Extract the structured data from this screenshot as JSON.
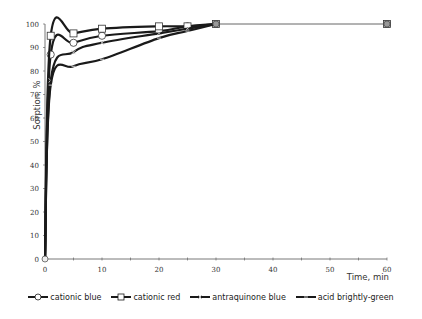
{
  "chart_data": {
    "type": "line",
    "title": "",
    "xlabel": "Time,  min",
    "ylabel": "Sorption, %",
    "xlim": [
      0,
      60
    ],
    "ylim": [
      0,
      100
    ],
    "x_ticks": [
      0,
      10,
      20,
      30,
      40,
      50,
      60
    ],
    "y_ticks": [
      0,
      10,
      20,
      30,
      40,
      50,
      60,
      70,
      80,
      90,
      100
    ],
    "grid": false,
    "legend_position": "bottom",
    "x": [
      0,
      1,
      5,
      10,
      20,
      25,
      30,
      60
    ],
    "series": [
      {
        "name": "cationic blue",
        "marker": "circle",
        "values": [
          0,
          87,
          92,
          95,
          97,
          99,
          100,
          100
        ]
      },
      {
        "name": "cationic red",
        "marker": "square",
        "values": [
          0,
          95,
          96,
          98,
          99,
          99,
          100,
          100
        ]
      },
      {
        "name": "antraquinone blue",
        "marker": "x",
        "values": [
          0,
          76,
          88,
          92,
          96,
          98,
          100,
          100
        ]
      },
      {
        "name": "acid brightly-green",
        "marker": "dash",
        "values": [
          0,
          74,
          82,
          85,
          94,
          97,
          100,
          100
        ]
      }
    ]
  },
  "legend": {
    "items": [
      {
        "label": "cationic blue"
      },
      {
        "label": "cationic red"
      },
      {
        "label": "antraquinone blue"
      },
      {
        "label": "acid brightly-green"
      }
    ]
  },
  "colors": {
    "line": "#1a1a1a",
    "axis": "#555555",
    "marker_fill": "#ffffff"
  }
}
